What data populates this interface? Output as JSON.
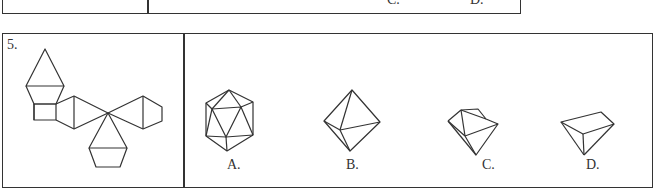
{
  "prev_question": {
    "option_labels": [
      "C.",
      "D."
    ]
  },
  "question": {
    "number": "5.",
    "net_description": "Net of a polyhedron: triangles, a square, and hexagon-capped faces meeting at a central vertex",
    "options": [
      {
        "label": "A.",
        "shape": "icosahedron-like polyhedron"
      },
      {
        "label": "B.",
        "shape": "octahedron"
      },
      {
        "label": "C.",
        "shape": "truncated solid with flat top"
      },
      {
        "label": "D.",
        "shape": "wedge-shaped solid"
      }
    ]
  }
}
